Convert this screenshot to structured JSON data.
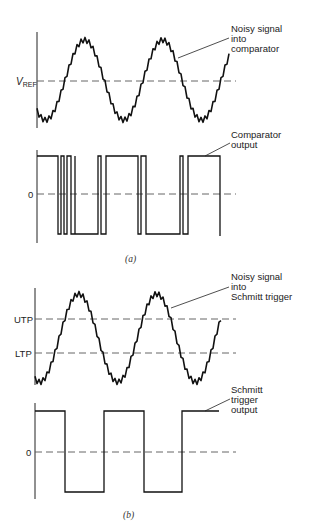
{
  "figure": {
    "panel_a": {
      "caption": "(a)",
      "input_plot": {
        "signal_label_lines": [
          "Noisy signal",
          "into",
          "comparator"
        ],
        "reference_label_main": "V",
        "reference_label_sub": "REF"
      },
      "output_plot": {
        "output_label_lines": [
          "Comparator",
          "output"
        ],
        "zero_label": "0"
      }
    },
    "panel_b": {
      "caption": "(b)",
      "input_plot": {
        "signal_label_lines": [
          "Noisy signal",
          "into",
          "Schmitt trigger"
        ],
        "utp_label": "UTP",
        "ltp_label": "LTP"
      },
      "output_plot": {
        "output_label_lines": [
          "Schmitt",
          "trigger",
          "output"
        ],
        "zero_label": "0"
      }
    }
  },
  "colors": {
    "ink": "#111111",
    "dashed": "#555555",
    "background": "#ffffff"
  }
}
